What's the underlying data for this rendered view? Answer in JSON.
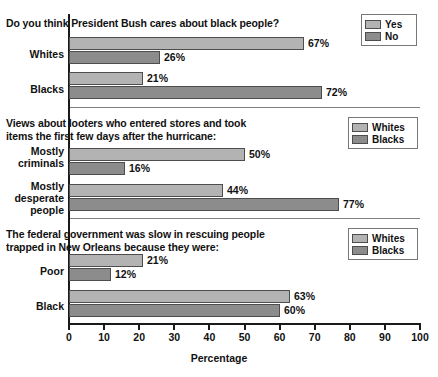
{
  "chart_data": {
    "type": "bar",
    "orientation": "horizontal",
    "title": "",
    "xlabel": "Percentage",
    "ylabel": "",
    "xlim": [
      0,
      100
    ],
    "xticks": [
      0,
      10,
      20,
      30,
      40,
      50,
      60,
      70,
      80,
      90,
      100
    ],
    "grid": false,
    "legend_position": "top-right",
    "panels": [
      {
        "id": "panel-bush-cares",
        "title": "Do you think President Bush cares about black people?",
        "legend": [
          {
            "label": "Yes",
            "shade": "light"
          },
          {
            "label": "No",
            "shade": "dark"
          }
        ],
        "categories": [
          "Whites",
          "Blacks"
        ],
        "series": [
          {
            "name": "Yes",
            "shade": "light",
            "values": [
              67,
              26
            ]
          },
          {
            "name": "No",
            "shade": "dark",
            "values": [
              21,
              72
            ]
          }
        ],
        "bars": [
          {
            "category": "Whites",
            "series": "Yes",
            "value": 67,
            "label": "67%",
            "shade": "light"
          },
          {
            "category": "Whites",
            "series": "No",
            "value": 26,
            "label": "26%",
            "shade": "dark"
          },
          {
            "category": "Blacks",
            "series": "Yes",
            "value": 21,
            "label": "21%",
            "shade": "light"
          },
          {
            "category": "Blacks",
            "series": "No",
            "value": 72,
            "label": "72%",
            "shade": "dark"
          }
        ]
      },
      {
        "id": "panel-looters",
        "title": "Views about looters who entered stores and took\nitems the first few days after the hurricane:",
        "legend": [
          {
            "label": "Whites",
            "shade": "light"
          },
          {
            "label": "Blacks",
            "shade": "dark"
          }
        ],
        "categories": [
          "Mostly\ncriminals",
          "Mostly\ndesperate\npeople"
        ],
        "series": [
          {
            "name": "Whites",
            "shade": "light",
            "values": [
              50,
              44
            ]
          },
          {
            "name": "Blacks",
            "shade": "dark",
            "values": [
              16,
              77
            ]
          }
        ],
        "bars": [
          {
            "category": "Mostly criminals",
            "series": "Whites",
            "value": 50,
            "label": "50%",
            "shade": "light"
          },
          {
            "category": "Mostly criminals",
            "series": "Blacks",
            "value": 16,
            "label": "16%",
            "shade": "dark"
          },
          {
            "category": "Mostly desperate people",
            "series": "Whites",
            "value": 44,
            "label": "44%",
            "shade": "light"
          },
          {
            "category": "Mostly desperate people",
            "series": "Blacks",
            "value": 77,
            "label": "77%",
            "shade": "dark"
          }
        ]
      },
      {
        "id": "panel-federal-slow",
        "title": "The federal government was slow in rescuing people\ntrapped in New Orleans because they were:",
        "legend": [
          {
            "label": "Whites",
            "shade": "light"
          },
          {
            "label": "Blacks",
            "shade": "dark"
          }
        ],
        "categories": [
          "Poor",
          "Black"
        ],
        "series": [
          {
            "name": "Whites",
            "shade": "light",
            "values": [
              21,
              63
            ]
          },
          {
            "name": "Blacks",
            "shade": "dark",
            "values": [
              12,
              60
            ]
          }
        ],
        "bars": [
          {
            "category": "Poor",
            "series": "Whites",
            "value": 21,
            "label": "21%",
            "shade": "light"
          },
          {
            "category": "Poor",
            "series": "Blacks",
            "value": 12,
            "label": "12%",
            "shade": "dark"
          },
          {
            "category": "Black",
            "series": "Whites",
            "value": 63,
            "label": "63%",
            "shade": "light"
          },
          {
            "category": "Black",
            "series": "Blacks",
            "value": 60,
            "label": "60%",
            "shade": "dark"
          }
        ]
      }
    ],
    "colors": {
      "light_bar": "#b3b3b3",
      "dark_bar": "#8c8c8c",
      "bar_outline": "#4d4d4d",
      "axis": "#1a1a1a",
      "separator": "#808080",
      "text": "#111111",
      "background": "#ffffff"
    }
  },
  "xaxis": {
    "title": "Percentage",
    "ticks": [
      "0",
      "10",
      "20",
      "30",
      "40",
      "50",
      "60",
      "70",
      "80",
      "90",
      "100"
    ]
  },
  "panel1": {
    "title": "Do you think President Bush cares about black people?",
    "legend": {
      "first": "Yes",
      "second": "No"
    },
    "cat1": "Whites",
    "cat2": "Blacks",
    "v1": "67%",
    "v2": "26%",
    "v3": "21%",
    "v4": "72%"
  },
  "panel2": {
    "title": "Views about looters who entered stores and took\nitems the first few days after the hurricane:",
    "legend": {
      "first": "Whites",
      "second": "Blacks"
    },
    "cat1": "Mostly\ncriminals",
    "cat2": "Mostly\ndesperate\npeople",
    "v1": "50%",
    "v2": "16%",
    "v3": "44%",
    "v4": "77%"
  },
  "panel3": {
    "title": "The federal government was slow in rescuing people\ntrapped in New Orleans because they were:",
    "legend": {
      "first": "Whites",
      "second": "Blacks"
    },
    "cat1": "Poor",
    "cat2": "Black",
    "v1": "21%",
    "v2": "12%",
    "v3": "63%",
    "v4": "60%"
  }
}
